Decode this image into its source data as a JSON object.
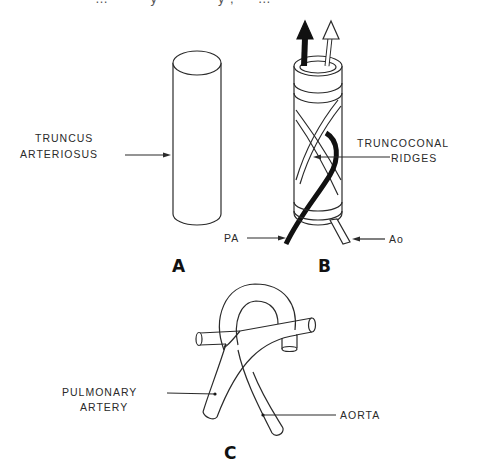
{
  "header": {
    "cutoff_text": "…         y             y ,     …"
  },
  "panels": {
    "a": {
      "letter": "A",
      "labels": {
        "line1": "TRUNCUS",
        "line2": "ARTERIOSUS"
      }
    },
    "b": {
      "letter": "B",
      "labels": {
        "ridges_line1": "TRUNCOCONAL",
        "ridges_line2": "RIDGES",
        "pa": "PA",
        "ao": "Ao"
      }
    },
    "c": {
      "letter": "C",
      "labels": {
        "pulmonary_line1": "PULMONARY",
        "pulmonary_line2": "ARTERY",
        "aorta": "AORTA"
      }
    }
  },
  "colors": {
    "line": "#2a2a2a",
    "fill": "#ffffff",
    "dark_band": "#111111"
  }
}
